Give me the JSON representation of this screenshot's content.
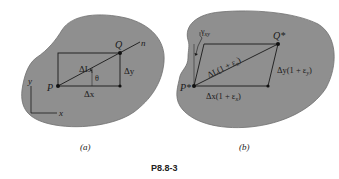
{
  "figure": {
    "id_label": "P8.8-3",
    "colors": {
      "body_fill": "#8f8f8f",
      "body_stroke": "#6a6a6a",
      "line": "#1a1a1a",
      "background": "#ffffff"
    },
    "panel_a": {
      "caption": "(a)",
      "point_p": "P",
      "point_q": "Q",
      "direction_n": "n",
      "length_label": "ΔL",
      "angle_label": "θ",
      "dx_label": "Δx",
      "dy_label": "Δy",
      "axis_x": "x",
      "axis_y": "y"
    },
    "panel_b": {
      "caption": "(b)",
      "point_p": "P*",
      "point_q": "Q*",
      "shear_label": "γxy",
      "shear_main": "γ",
      "shear_sub": "xy",
      "length_label": "ΔL(1 + εn)",
      "length_main": "ΔL(1 + ε",
      "length_sub": "n",
      "length_close": ")",
      "dx_main": "Δx(1 + ε",
      "dx_sub": "x",
      "dx_close": ")",
      "dy_main": "Δy(1 + ε",
      "dy_sub": "y",
      "dy_close": ")"
    }
  }
}
